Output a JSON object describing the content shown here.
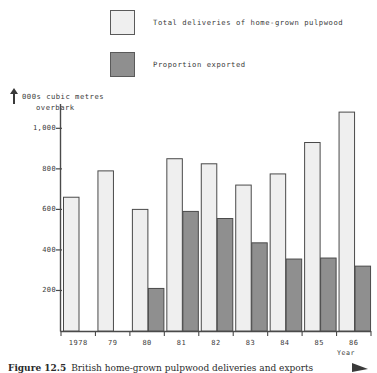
{
  "legend": {
    "items": [
      {
        "label": "Total deliveries of home-grown pulpwood",
        "swatch": "light-square-icon",
        "color": "#efefef"
      },
      {
        "label": "Proportion exported",
        "swatch": "dark-square-icon",
        "color": "#8f8f8f"
      }
    ]
  },
  "axis_title": {
    "line1": "000s cubic metres",
    "line2": "overbark"
  },
  "year_axis_caption": "Year",
  "figure_caption": {
    "number": "Figure 12.5",
    "text": "British home-grown pulpwood deliveries and exports"
  },
  "chart_data": {
    "type": "bar",
    "title": "",
    "subtitle": "",
    "xlabel": "Year",
    "ylabel": "000s cubic metres overbark",
    "categories": [
      "1978",
      "79",
      "80",
      "81",
      "82",
      "83",
      "84",
      "85",
      "86"
    ],
    "series": [
      {
        "name": "Total deliveries of home-grown pulpwood",
        "color": "#efefef",
        "values": [
          660,
          790,
          600,
          850,
          825,
          720,
          775,
          930,
          1080
        ]
      },
      {
        "name": "Proportion exported",
        "color": "#8f8f8f",
        "values": [
          0,
          0,
          210,
          590,
          555,
          435,
          355,
          360,
          320
        ]
      }
    ],
    "ylim": [
      0,
      1120
    ],
    "yticks": [
      200,
      400,
      600,
      800,
      1000
    ],
    "ytick_labels": [
      "200",
      "400",
      "600",
      "800",
      "1,000"
    ],
    "grid": false,
    "legend_position": "top-left"
  }
}
